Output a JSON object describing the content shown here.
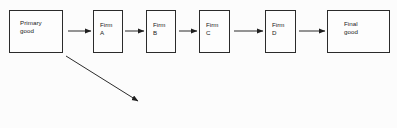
{
  "diagram": {
    "type": "flow-chart",
    "background_color": "#fcfcfc",
    "stroke_color": "#2b2b2b",
    "text_color": "#1a1a1a",
    "nodes": [
      {
        "id": "primary-good",
        "label": "Primary\ngood",
        "label_style": "wide-node",
        "x": 9,
        "y": 10,
        "width": 54,
        "height": 43
      },
      {
        "id": "firm-a",
        "label": "Firm\nA",
        "label_style": "narrow-node",
        "x": 93,
        "y": 10,
        "width": 30,
        "height": 43
      },
      {
        "id": "firm-b",
        "label": "Firm\nB",
        "label_style": "narrow-node",
        "x": 146,
        "y": 10,
        "width": 30,
        "height": 43
      },
      {
        "id": "firm-c",
        "label": "Firm\nC",
        "label_style": "narrow-node",
        "x": 199,
        "y": 10,
        "width": 31,
        "height": 43
      },
      {
        "id": "firm-d",
        "label": "Firm\nD",
        "label_style": "narrow-node",
        "x": 265,
        "y": 10,
        "width": 31,
        "height": 43
      },
      {
        "id": "final-good",
        "label": "Final\ngood",
        "label_style": "final-node",
        "x": 327,
        "y": 10,
        "width": 63,
        "height": 43
      }
    ],
    "connectors": [
      {
        "id": "arrow-primary-to-firm-a",
        "from": "primary-good",
        "to": "firm-a",
        "orientation": "horizontal",
        "x1": 68,
        "y1": 31,
        "x2": 91,
        "y2": 31
      },
      {
        "id": "arrow-firm-a-to-firm-b",
        "from": "firm-a",
        "to": "firm-b",
        "orientation": "horizontal",
        "x1": 125,
        "y1": 31,
        "x2": 144,
        "y2": 31
      },
      {
        "id": "arrow-firm-b-to-firm-c",
        "from": "firm-b",
        "to": "firm-c",
        "orientation": "horizontal",
        "x1": 179,
        "y1": 31,
        "x2": 197,
        "y2": 31
      },
      {
        "id": "arrow-firm-c-to-firm-d",
        "from": "firm-c",
        "to": "firm-d",
        "orientation": "horizontal",
        "x1": 234,
        "y1": 31,
        "x2": 263,
        "y2": 31
      },
      {
        "id": "arrow-firm-d-to-final-good",
        "from": "firm-d",
        "to": "final-good",
        "orientation": "horizontal",
        "x1": 299,
        "y1": 31,
        "x2": 325,
        "y2": 31
      },
      {
        "id": "arrow-primary-good-diagonal",
        "from": "primary-good",
        "to": "",
        "orientation": "diagonal",
        "x1": 66,
        "y1": 56,
        "x2": 138,
        "y2": 101
      }
    ]
  }
}
